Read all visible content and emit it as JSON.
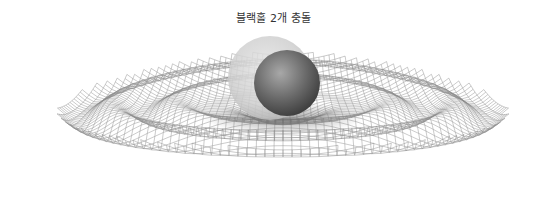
{
  "title": "블랙홀 2개 충돌",
  "illustration": {
    "subject": "two black holes colliding",
    "elements": [
      {
        "name": "spacetime-mesh",
        "description": "wireframe grid with concentric gravitational wave ripples"
      },
      {
        "name": "black-hole-back",
        "description": "larger translucent light-gray sphere"
      },
      {
        "name": "black-hole-front",
        "description": "smaller darker gray sphere"
      }
    ],
    "colors": {
      "background": "#ffffff",
      "mesh_line": "#8a8a8a",
      "sphere_back": "#d2d2d2",
      "sphere_front_light": "#9a9a9a",
      "sphere_front_dark": "#3e3e3e",
      "title_text": "#333333"
    }
  }
}
